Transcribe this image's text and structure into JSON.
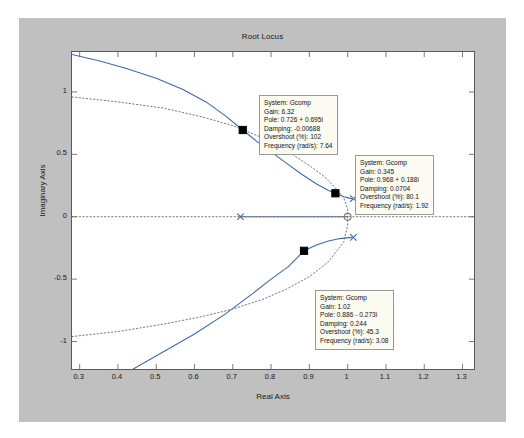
{
  "figure": {
    "title": "Root Locus",
    "background_color": "#c0c0c0",
    "axes_background_color": "#ffffff"
  },
  "chart_data": {
    "type": "line",
    "title": "Root Locus",
    "xlabel": "Real Axis",
    "ylabel": "Imaginary Axis",
    "xlim": [
      0.28,
      1.33
    ],
    "ylim": [
      -1.22,
      1.32
    ],
    "xticks": [
      "0.3",
      "0.4",
      "0.5",
      "0.6",
      "0.7",
      "0.8",
      "0.9",
      "1",
      "1.1",
      "1.2",
      "1.3"
    ],
    "xtick_values": [
      0.3,
      0.4,
      0.5,
      0.6,
      0.7,
      0.8,
      0.9,
      1.0,
      1.1,
      1.2,
      1.3
    ],
    "yticks": [
      "1",
      "0.5",
      "0",
      "-0.5",
      "-1"
    ],
    "ytick_values": [
      1,
      0.5,
      0,
      -0.5,
      -1
    ],
    "grid": false,
    "legend": null,
    "series": [
      {
        "name": "root-locus-branch-upper",
        "style": "solid",
        "color": "#4169a8",
        "points": [
          [
            0.28,
            1.3
          ],
          [
            0.35,
            1.25
          ],
          [
            0.42,
            1.19
          ],
          [
            0.5,
            1.11
          ],
          [
            0.57,
            1.02
          ],
          [
            0.63,
            0.92
          ],
          [
            0.68,
            0.81
          ],
          [
            0.726,
            0.695
          ],
          [
            0.76,
            0.61
          ],
          [
            0.8,
            0.52
          ],
          [
            0.84,
            0.43
          ],
          [
            0.88,
            0.34
          ],
          [
            0.92,
            0.26
          ],
          [
            0.95,
            0.21
          ],
          [
            0.968,
            0.188
          ],
          [
            0.99,
            0.16
          ],
          [
            1.01,
            0.145
          ]
        ]
      },
      {
        "name": "root-locus-branch-lower",
        "style": "solid",
        "color": "#4169a8",
        "points": [
          [
            0.44,
            -1.22
          ],
          [
            0.52,
            -1.08
          ],
          [
            0.6,
            -0.94
          ],
          [
            0.68,
            -0.78
          ],
          [
            0.75,
            -0.62
          ],
          [
            0.8,
            -0.5
          ],
          [
            0.845,
            -0.4
          ],
          [
            0.886,
            -0.273
          ],
          [
            0.92,
            -0.225
          ],
          [
            0.95,
            -0.195
          ],
          [
            0.98,
            -0.175
          ],
          [
            1.01,
            -0.165
          ]
        ]
      },
      {
        "name": "damping-grid-upper",
        "style": "dotted",
        "color": "#7a7a7a",
        "points": [
          [
            0.28,
            0.96
          ],
          [
            0.4,
            0.92
          ],
          [
            0.52,
            0.87
          ],
          [
            0.62,
            0.8
          ],
          [
            0.7,
            0.73
          ],
          [
            0.78,
            0.63
          ],
          [
            0.84,
            0.53
          ],
          [
            0.9,
            0.41
          ],
          [
            0.94,
            0.32
          ],
          [
            0.968,
            0.23
          ],
          [
            0.99,
            0.15
          ],
          [
            1.0,
            0.06
          ],
          [
            1.0,
            0.0
          ]
        ]
      },
      {
        "name": "damping-grid-lower",
        "style": "dotted",
        "color": "#7a7a7a",
        "points": [
          [
            0.28,
            -0.96
          ],
          [
            0.4,
            -0.92
          ],
          [
            0.52,
            -0.86
          ],
          [
            0.62,
            -0.8
          ],
          [
            0.7,
            -0.74
          ],
          [
            0.78,
            -0.66
          ],
          [
            0.84,
            -0.58
          ],
          [
            0.9,
            -0.48
          ],
          [
            0.95,
            -0.36
          ],
          [
            0.99,
            -0.2
          ],
          [
            1.0,
            -0.07
          ],
          [
            1.0,
            0.0
          ]
        ]
      },
      {
        "name": "real-axis-locus-segment",
        "style": "solid",
        "color": "#4169a8",
        "points": [
          [
            0.72,
            0.0
          ],
          [
            1.0,
            0.0
          ]
        ]
      },
      {
        "name": "unit-circle-dotted-axis",
        "style": "dotted",
        "color": "#7a7a7a",
        "points": [
          [
            0.28,
            0.0
          ],
          [
            1.33,
            0.0
          ]
        ]
      }
    ],
    "markers": [
      {
        "name": "open-loop-pole-left",
        "symbol": "x",
        "x": 0.72,
        "y": 0.0,
        "color": "#4169a8"
      },
      {
        "name": "open-loop-zero-origin",
        "symbol": "o",
        "x": 1.0,
        "y": 0.0,
        "color": "#7a7a7a"
      },
      {
        "name": "open-loop-pole-upper",
        "symbol": "x",
        "x": 1.015,
        "y": 0.145,
        "color": "#4169a8"
      },
      {
        "name": "open-loop-pole-lower",
        "symbol": "x",
        "x": 1.015,
        "y": -0.165,
        "color": "#4169a8"
      },
      {
        "name": "selected-pole-1",
        "symbol": "square",
        "x": 0.726,
        "y": 0.695,
        "color": "#000000"
      },
      {
        "name": "selected-pole-2",
        "symbol": "square",
        "x": 0.968,
        "y": 0.188,
        "color": "#000000"
      },
      {
        "name": "selected-pole-3",
        "symbol": "square",
        "x": 0.886,
        "y": -0.273,
        "color": "#000000"
      }
    ],
    "annotations": [
      {
        "id": "datatip-1",
        "system": "System: Gcomp",
        "gain": "Gain: 6.32",
        "pole": "Pole: 0.726 + 0.695i",
        "damping": "Damping: -0.00688",
        "overshoot": "Overshoot (%): 102",
        "frequency": "Frequency (rad/s): 7.64"
      },
      {
        "id": "datatip-2",
        "system": "System: Gcomp",
        "gain": "Gain: 0.345",
        "pole": "Pole: 0.968 + 0.188i",
        "damping": "Damping: 0.0704",
        "overshoot": "Overshoot (%): 80.1",
        "frequency": "Frequency (rad/s): 1.92"
      },
      {
        "id": "datatip-3",
        "system": "System: Gcomp",
        "gain": "Gain: 1.02",
        "pole": "Pole: 0.886 - 0.273i",
        "damping": "Damping: 0.244",
        "overshoot": "Overshoot (%): 45.3",
        "frequency": "Frequency (rad/s): 3.08"
      }
    ]
  }
}
